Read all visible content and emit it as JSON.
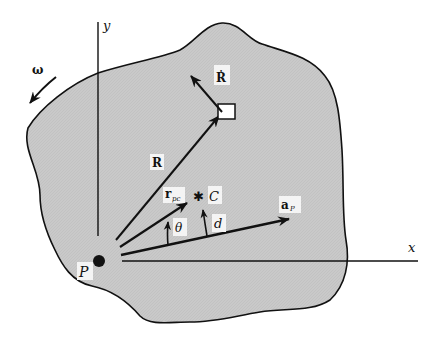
{
  "diagram": {
    "type": "rigid-body-kinematics",
    "colors": {
      "body_fill": "#c9c9c9",
      "outline": "#111111",
      "background": "#ffffff",
      "label_bg": "#f4f4f4"
    },
    "axes": {
      "x_label": "x",
      "y_label": "y"
    },
    "labels": {
      "omega": "ω",
      "R_dot": "Ṙ",
      "R": "R",
      "r_pc_main": "r",
      "r_pc_sub": "pc",
      "C": "C",
      "a_P_main": "a",
      "a_P_sub": "P",
      "theta": "θ",
      "d": "d",
      "P": "P"
    }
  }
}
